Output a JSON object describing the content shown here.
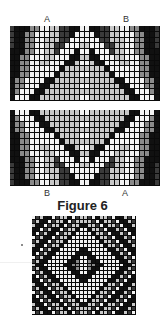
{
  "figure": {
    "caption": "Figure 6",
    "top_labels": {
      "left": "A",
      "right": "B"
    },
    "bottom_labels": {
      "left": "B",
      "right": "A"
    }
  },
  "patterns": [
    {
      "id": "pattern-top",
      "type": "chevron-up",
      "x": 10,
      "y": 26,
      "width": 150,
      "height": 75,
      "cols": 30,
      "rows": 13
    },
    {
      "id": "pattern-middle",
      "type": "chevron-down",
      "x": 10,
      "y": 110,
      "width": 150,
      "height": 76,
      "cols": 30,
      "rows": 13
    },
    {
      "id": "pattern-bottom",
      "type": "diamond",
      "x": 32,
      "y": 216,
      "width": 104,
      "height": 99,
      "cols": 26,
      "rows": 25
    }
  ],
  "colors": {
    "black": "#111111",
    "dark": "#3a3a3a",
    "mid": "#8a8a8a",
    "light": "#c8c8c8",
    "white": "#f2f2f2"
  }
}
